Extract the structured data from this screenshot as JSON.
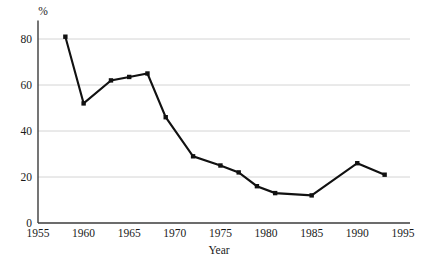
{
  "chart_data": {
    "type": "line",
    "title": "",
    "subtitle": "",
    "xlabel": "Year",
    "ylabel": "",
    "unit_label": "%",
    "xlim": [
      1955,
      1996
    ],
    "ylim": [
      0,
      88
    ],
    "xticks": [
      1955,
      1960,
      1965,
      1970,
      1975,
      1980,
      1985,
      1990,
      1995
    ],
    "xticklabels": [
      "1955",
      "1960",
      "1965",
      "1970",
      "1975",
      "1980",
      "1985",
      "1990",
      "1995"
    ],
    "yticks": [
      0,
      20,
      40,
      60,
      80
    ],
    "yticklabels": [
      "0",
      "20",
      "40",
      "60",
      "80"
    ],
    "grid": "horizontal",
    "legend": "none",
    "marker": "square",
    "line_color": "#111111",
    "grid_color": "#cfcfcf",
    "axis_color": "#3b3b3b",
    "x": [
      1958,
      1960,
      1963,
      1965,
      1967,
      1969,
      1972,
      1975,
      1977,
      1979,
      1981,
      1985,
      1990,
      1993
    ],
    "values": [
      81,
      52,
      62,
      63.5,
      65,
      46,
      29,
      25,
      22,
      16,
      13,
      12,
      26,
      21
    ],
    "points": [
      {
        "x": 1958,
        "y": 81
      },
      {
        "x": 1960,
        "y": 52
      },
      {
        "x": 1963,
        "y": 62
      },
      {
        "x": 1965,
        "y": 63.5
      },
      {
        "x": 1967,
        "y": 65
      },
      {
        "x": 1969,
        "y": 46
      },
      {
        "x": 1972,
        "y": 29
      },
      {
        "x": 1975,
        "y": 25
      },
      {
        "x": 1977,
        "y": 22
      },
      {
        "x": 1979,
        "y": 16
      },
      {
        "x": 1981,
        "y": 13
      },
      {
        "x": 1985,
        "y": 12
      },
      {
        "x": 1990,
        "y": 26
      },
      {
        "x": 1993,
        "y": 21
      }
    ],
    "series": [
      {
        "name": "",
        "values": [
          81,
          52,
          62,
          63.5,
          65,
          46,
          29,
          25,
          22,
          16,
          13,
          12,
          26,
          21
        ]
      }
    ]
  }
}
